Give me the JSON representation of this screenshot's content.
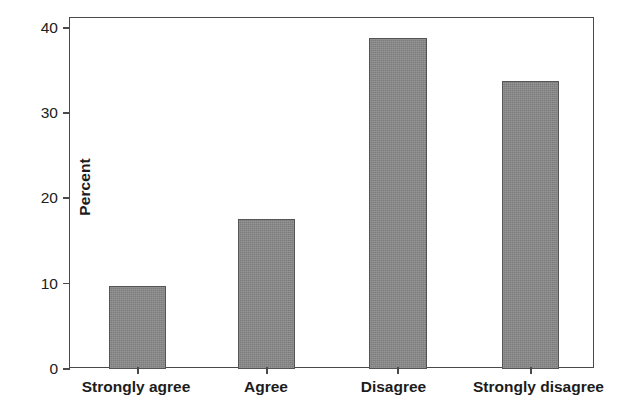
{
  "chart_data": {
    "type": "bar",
    "title": "",
    "subtitle": "",
    "xlabel": "",
    "ylabel": "Percent",
    "categories": [
      "Strongly agree",
      "Agree",
      "Disagree",
      "Strongly disagree"
    ],
    "values": [
      9.7,
      17.6,
      38.8,
      33.8
    ],
    "ylim": [
      0,
      40
    ],
    "yticks": [
      0,
      10,
      20,
      30,
      40
    ],
    "ytick_labels": [
      "0",
      "10",
      "20",
      "30",
      "40"
    ],
    "grid": false,
    "legend": false,
    "legend_position": "none",
    "bar_color": "#898989",
    "bar_edge_color": "#555555",
    "axis_color": "#4a4a4a",
    "background_color": "#ffffff"
  },
  "axes": {
    "y_title": "Percent",
    "y_ticks": [
      {
        "label": "40",
        "value": 40
      },
      {
        "label": "30",
        "value": 30
      },
      {
        "label": "20",
        "value": 20
      },
      {
        "label": "10",
        "value": 10
      },
      {
        "label": "0",
        "value": 0
      }
    ],
    "x_ticks": [
      {
        "label": "Strongly agree",
        "value": 9.7
      },
      {
        "label": "Agree",
        "value": 17.6
      },
      {
        "label": "Disagree",
        "value": 38.8
      },
      {
        "label": "Strongly disagree",
        "value": 33.8
      }
    ]
  }
}
